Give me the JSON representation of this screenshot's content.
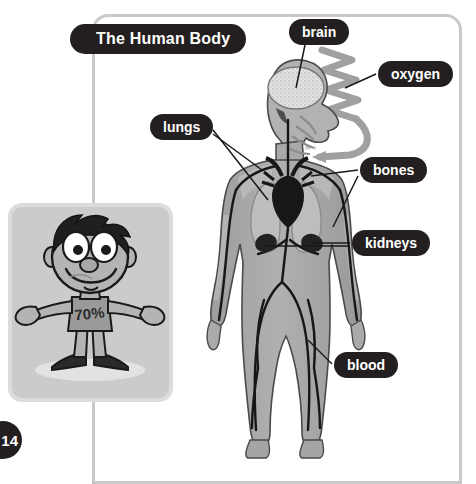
{
  "page": {
    "number": "14",
    "background_color": "#ffffff",
    "frame_color": "#c9c9c9"
  },
  "title": {
    "text": "The Human Body",
    "background_color": "#231f20",
    "text_color": "#ffffff"
  },
  "diagram": {
    "labels": [
      {
        "id": "brain",
        "text": "brain",
        "icon": "callout-pill"
      },
      {
        "id": "oxygen",
        "text": "oxygen",
        "icon": "callout-pill"
      },
      {
        "id": "lungs",
        "text": "lungs",
        "icon": "callout-pill"
      },
      {
        "id": "bones",
        "text": "bones",
        "icon": "callout-pill"
      },
      {
        "id": "kidneys",
        "text": "kidneys",
        "icon": "callout-pill"
      },
      {
        "id": "blood",
        "text": "blood",
        "icon": "callout-pill"
      }
    ],
    "body_fill": "#a8a8a8",
    "organ_dark": "#1a1a1a",
    "oxygen_arrow_color": "#9b9b9b"
  },
  "inset": {
    "caption_value": "70%",
    "subject": "cartoon-boy",
    "background_color": "#cbcbcb",
    "border_color": "#dcdcdc"
  }
}
